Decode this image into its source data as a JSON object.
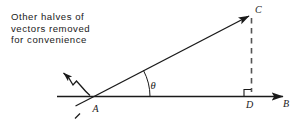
{
  "figure": {
    "width": 302,
    "height": 133,
    "background": "#ffffff",
    "ink": "#1a1a1a",
    "dash_color": "#555555"
  },
  "note": {
    "lines": [
      "Other halves of",
      "vectors removed",
      "for convenience"
    ]
  },
  "labels": {
    "point_a": "A",
    "point_b": "B",
    "point_c": "C",
    "point_d": "D",
    "angle_theta": "θ"
  },
  "geometry": {
    "a": [
      94,
      97
    ],
    "b_arrow_tip": [
      285,
      97
    ],
    "c_arrow_tip": [
      252,
      14
    ],
    "d": [
      252,
      97
    ],
    "baseline_start": [
      57,
      97
    ],
    "ac_extension_end": [
      75,
      119
    ],
    "right_angle_marker": true,
    "dashed_vertical": true,
    "squiggle_arrow_tip": [
      61,
      71
    ],
    "theta_arc_radius": 56
  }
}
